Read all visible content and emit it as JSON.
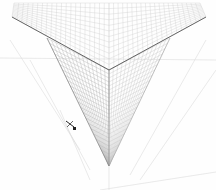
{
  "canvas": {
    "description": "Three-point perspective grid drawing of a box corner",
    "background": "#fefefe",
    "grid_color": "#b8b8b8",
    "edge_color": "#555555",
    "guide_color": "#d4d4d4"
  },
  "geometry": {
    "top_vertex": [
      109,
      70
    ],
    "bottom_vertex": [
      109,
      166
    ],
    "left_top": [
      12,
      17
    ],
    "right_top": [
      206,
      17
    ],
    "left_face_top": [
      47,
      38
    ],
    "right_face_top": [
      170,
      38
    ]
  },
  "cursor": {
    "icon": "move-cursor-icon",
    "x": 70,
    "y": 124
  }
}
